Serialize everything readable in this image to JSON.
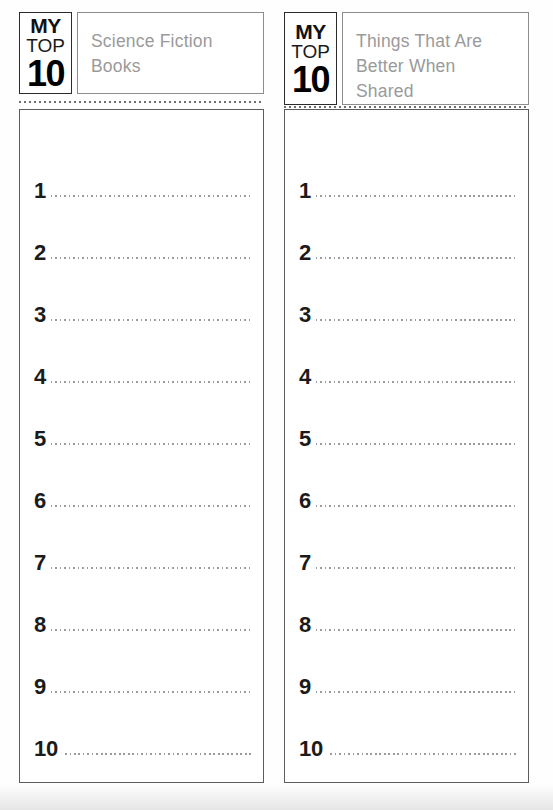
{
  "document": {
    "type": "printable-worksheet",
    "background_color": "#fefefe"
  },
  "logo": {
    "line1": "MY",
    "line2": "TOP",
    "line3": "10"
  },
  "colors": {
    "number_color": "#1b1b1b",
    "title_color": "#9a9a9a",
    "dotted_line_color": "#9b9b9b",
    "box_border_color": "#5c5c5c",
    "logo_border_color": "#2b2b2b"
  },
  "columns": [
    {
      "id": "left-column",
      "title": "Science Fiction\nBooks",
      "rows": [
        {
          "number": "1",
          "value": ""
        },
        {
          "number": "2",
          "value": ""
        },
        {
          "number": "3",
          "value": ""
        },
        {
          "number": "4",
          "value": ""
        },
        {
          "number": "5",
          "value": ""
        },
        {
          "number": "6",
          "value": ""
        },
        {
          "number": "7",
          "value": ""
        },
        {
          "number": "8",
          "value": ""
        },
        {
          "number": "9",
          "value": ""
        },
        {
          "number": "10",
          "value": ""
        }
      ]
    },
    {
      "id": "right-column",
      "title": "Things That Are\nBetter When\nShared",
      "rows": [
        {
          "number": "1",
          "value": ""
        },
        {
          "number": "2",
          "value": ""
        },
        {
          "number": "3",
          "value": ""
        },
        {
          "number": "4",
          "value": ""
        },
        {
          "number": "5",
          "value": ""
        },
        {
          "number": "6",
          "value": ""
        },
        {
          "number": "7",
          "value": ""
        },
        {
          "number": "8",
          "value": ""
        },
        {
          "number": "9",
          "value": ""
        },
        {
          "number": "10",
          "value": ""
        }
      ]
    }
  ]
}
